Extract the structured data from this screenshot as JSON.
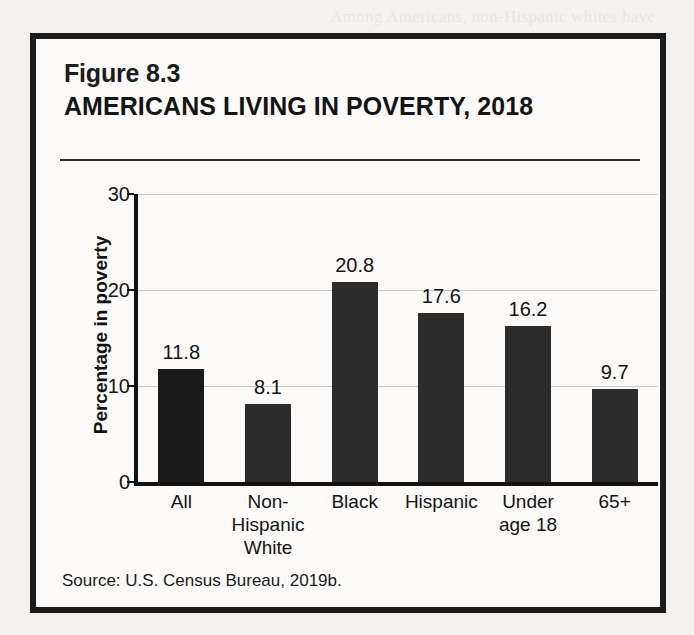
{
  "figure": {
    "number": "Figure 8.3",
    "title": "AMERICANS LIVING IN POVERTY, 2018",
    "source": "Source:  U.S. Census Bureau, 2019b."
  },
  "chart_data": {
    "type": "bar",
    "title": "AMERICANS LIVING IN POVERTY, 2018",
    "xlabel": "",
    "ylabel": "Percentage in poverty",
    "ylim": [
      0,
      30
    ],
    "yticks": [
      "0",
      "10",
      "20",
      "30"
    ],
    "grid": true,
    "legend": "none",
    "bar_color": "#2c2c2c",
    "categories": [
      "All",
      "Non-\nHispanic\nWhite",
      "Black",
      "Hispanic",
      "Under\nage 18",
      "65+"
    ],
    "category_lines": [
      [
        "All"
      ],
      [
        "Non-",
        "Hispanic",
        "White"
      ],
      [
        "Black"
      ],
      [
        "Hispanic"
      ],
      [
        "Under",
        "age 18"
      ],
      [
        "65+"
      ]
    ],
    "values": [
      11.8,
      8.1,
      20.8,
      17.6,
      16.2,
      9.7
    ],
    "value_labels": [
      "11.8",
      "8.1",
      "20.8",
      "17.6",
      "16.2",
      "9.7"
    ]
  }
}
